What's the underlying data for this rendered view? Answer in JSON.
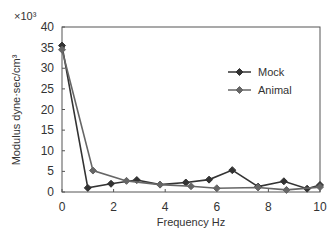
{
  "chart_data": {
    "type": "line",
    "title": "",
    "xlabel": "Frequency  Hz",
    "ylabel": "Modulus dyne·sec/cm³",
    "y_multiplier": "×10³",
    "xlim": [
      0,
      10
    ],
    "ylim": [
      0,
      40
    ],
    "x_ticks": [
      "0",
      "2",
      "4",
      "6",
      "8",
      "10"
    ],
    "y_ticks": [
      "0",
      "5",
      "10",
      "15",
      "20",
      "25",
      "30",
      "35",
      "40"
    ],
    "grid": false,
    "legend_position": "upper right",
    "series": [
      {
        "name": "Mock",
        "color": "#333333",
        "x": [
          0,
          1.0,
          1.9,
          2.9,
          3.8,
          4.8,
          5.7,
          6.6,
          7.6,
          8.6,
          9.5,
          10
        ],
        "y": [
          35.5,
          1.0,
          2.0,
          2.9,
          1.8,
          2.3,
          3.0,
          5.3,
          1.3,
          2.6,
          0.8,
          1.7
        ]
      },
      {
        "name": "Animal",
        "color": "#666666",
        "x": [
          0,
          1.2,
          2.5,
          3.8,
          5.0,
          6.0,
          7.6,
          8.7,
          10
        ],
        "y": [
          34.5,
          5.2,
          2.7,
          1.8,
          1.4,
          0.9,
          1.1,
          0.5,
          1.2
        ]
      }
    ]
  }
}
